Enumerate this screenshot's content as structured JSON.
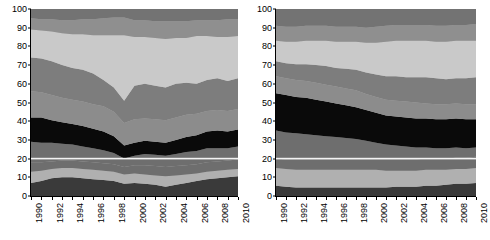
{
  "figure": {
    "type": "two-panel-stacked-area",
    "background": "#ffffff",
    "panel_count": 2
  },
  "axis": {
    "y_ticks": [
      "0",
      "10",
      "20",
      "30",
      "40",
      "50",
      "60",
      "70",
      "80",
      "90",
      "100"
    ],
    "x_ticks": [
      "1990",
      "1992",
      "1994",
      "1996",
      "1998",
      "2000",
      "2002",
      "2004",
      "2006",
      "2008",
      "2010"
    ],
    "y_min": 0,
    "y_max": 100,
    "x_min": 1990,
    "x_max": 2010
  },
  "colors": {
    "band_1": "#3a3a3a",
    "band_2": "#8c8c8c",
    "band_3": "#b0b0b0",
    "band_4": "#6e6e6e",
    "band_5": "#0a0a0a",
    "band_6": "#737373",
    "band_7": "#a8a8a8",
    "band_8": "#c9c9c9",
    "band_9": "#7d7d7d",
    "band_10": "#8f8f8f",
    "separator": "#f2f2f2",
    "axis": "#000000",
    "text": "#000000"
  },
  "chart_data": [
    {
      "type": "area",
      "title": "",
      "xlabel": "",
      "ylabel": "",
      "stacked": true,
      "normalized": true,
      "ylim": [
        0,
        100
      ],
      "xlim": [
        1990,
        2010
      ],
      "grid": false,
      "legend": "none",
      "panel": "left",
      "x": [
        1990,
        1991,
        1992,
        1993,
        1994,
        1995,
        1996,
        1997,
        1998,
        1999,
        2000,
        2001,
        2002,
        2003,
        2004,
        2005,
        2006,
        2007,
        2008,
        2009,
        2010
      ],
      "series": [
        {
          "name": "band-1",
          "color": "#3a3a3a",
          "values": [
            7.0,
            8.0,
            9.5,
            10.0,
            10.0,
            9.5,
            9.0,
            8.5,
            8.0,
            6.5,
            7.0,
            6.5,
            6.0,
            5.0,
            6.0,
            7.0,
            8.0,
            9.0,
            9.5,
            10.0,
            10.5
          ]
        },
        {
          "name": "band-2",
          "color": "#b0b0b0",
          "values": [
            6.0,
            5.5,
            5.0,
            5.0,
            5.0,
            5.0,
            5.0,
            5.0,
            5.0,
            5.0,
            5.0,
            5.0,
            5.0,
            5.5,
            5.0,
            4.5,
            4.0,
            4.0,
            4.0,
            4.0,
            4.0
          ]
        },
        {
          "name": "band-3",
          "color": "#6e6e6e",
          "values": [
            5.0,
            4.5,
            4.0,
            4.0,
            4.0,
            4.0,
            4.0,
            4.0,
            4.0,
            4.0,
            4.5,
            5.0,
            5.0,
            5.0,
            5.0,
            5.0,
            5.0,
            5.0,
            5.0,
            5.0,
            5.0
          ]
        },
        {
          "name": "band-4",
          "color": "#6e6e6e",
          "values": [
            11.0,
            10.5,
            10.0,
            9.0,
            8.5,
            8.0,
            7.5,
            7.0,
            6.0,
            4.5,
            5.0,
            6.0,
            6.0,
            6.0,
            6.5,
            7.0,
            7.0,
            7.5,
            7.0,
            6.5,
            7.0
          ]
        },
        {
          "name": "band-5",
          "color": "#0a0a0a",
          "values": [
            13.0,
            13.5,
            12.0,
            11.5,
            11.0,
            11.0,
            10.5,
            10.0,
            9.0,
            7.0,
            7.0,
            7.0,
            7.0,
            7.0,
            7.5,
            8.0,
            8.5,
            9.0,
            9.5,
            9.0,
            9.0
          ]
        },
        {
          "name": "band-6",
          "color": "#8c8c8c",
          "values": [
            14.0,
            13.5,
            13.5,
            13.0,
            13.0,
            13.0,
            13.0,
            13.5,
            13.0,
            12.0,
            12.5,
            12.0,
            12.0,
            12.0,
            12.0,
            12.0,
            11.5,
            11.0,
            11.0,
            11.0,
            11.0
          ]
        },
        {
          "name": "band-7",
          "color": "#7d7d7d",
          "values": [
            18.0,
            18.0,
            18.0,
            17.5,
            17.0,
            17.0,
            16.5,
            14.0,
            13.0,
            12.0,
            18.0,
            18.5,
            18.0,
            17.5,
            18.0,
            17.0,
            16.0,
            16.5,
            17.0,
            16.0,
            16.5
          ]
        },
        {
          "name": "band-8",
          "color": "#c9c9c9",
          "values": [
            15.0,
            15.0,
            16.0,
            17.0,
            18.0,
            19.0,
            20.5,
            24.0,
            28.0,
            35.0,
            26.0,
            25.0,
            25.5,
            26.0,
            24.5,
            24.0,
            25.5,
            23.5,
            22.0,
            23.5,
            22.5
          ]
        },
        {
          "name": "band-9",
          "color": "#8f8f8f",
          "values": [
            6.0,
            6.0,
            6.5,
            7.0,
            7.5,
            8.0,
            8.5,
            9.0,
            9.5,
            9.5,
            9.0,
            9.0,
            9.0,
            9.5,
            9.0,
            9.0,
            8.5,
            8.5,
            9.0,
            9.5,
            9.0
          ]
        },
        {
          "name": "band-10",
          "color": "#737373",
          "values": [
            5.0,
            5.5,
            5.5,
            6.0,
            6.0,
            5.5,
            5.5,
            5.0,
            4.5,
            4.5,
            6.0,
            6.0,
            6.5,
            6.5,
            6.5,
            6.5,
            6.0,
            6.0,
            6.0,
            5.5,
            5.5
          ]
        }
      ],
      "boundaries_1990": [
        7,
        13,
        18,
        29,
        42,
        56,
        74,
        89,
        95,
        100
      ],
      "boundaries_2010": [
        10.5,
        14.5,
        19.5,
        26.5,
        35.5,
        46.5,
        63,
        85.5,
        94.5,
        100
      ],
      "notes": "Pronounced V-shaped dip centred on 1999 in the upper-middle bands; light band expands sharply to its maximum there."
    },
    {
      "type": "area",
      "title": "",
      "xlabel": "",
      "ylabel": "",
      "stacked": true,
      "normalized": true,
      "ylim": [
        0,
        100
      ],
      "xlim": [
        1990,
        2010
      ],
      "grid": false,
      "legend": "none",
      "panel": "right",
      "x": [
        1990,
        1991,
        1992,
        1993,
        1994,
        1995,
        1996,
        1997,
        1998,
        1999,
        2000,
        2001,
        2002,
        2003,
        2004,
        2005,
        2006,
        2007,
        2008,
        2009,
        2010
      ],
      "series": [
        {
          "name": "band-1",
          "color": "#3a3a3a",
          "values": [
            5.5,
            5.0,
            4.5,
            4.5,
            4.5,
            4.5,
            4.5,
            4.5,
            4.5,
            4.5,
            4.5,
            4.5,
            5.0,
            5.0,
            5.0,
            5.5,
            5.5,
            6.0,
            6.5,
            6.5,
            7.0
          ]
        },
        {
          "name": "band-2",
          "color": "#b0b0b0",
          "values": [
            9.5,
            9.5,
            9.5,
            9.5,
            9.5,
            9.5,
            9.5,
            9.5,
            9.5,
            9.5,
            9.5,
            9.0,
            8.5,
            8.5,
            8.5,
            8.5,
            8.5,
            8.0,
            8.0,
            8.0,
            8.0
          ]
        },
        {
          "name": "band-3",
          "color": "#6e6e6e",
          "values": [
            5.0,
            5.0,
            5.5,
            5.5,
            5.5,
            5.5,
            5.5,
            5.5,
            5.5,
            5.5,
            5.5,
            6.0,
            6.0,
            6.0,
            6.0,
            6.0,
            6.0,
            6.0,
            6.0,
            6.0,
            6.0
          ]
        },
        {
          "name": "band-4",
          "color": "#6e6e6e",
          "values": [
            15.0,
            14.5,
            14.0,
            13.5,
            13.0,
            12.5,
            12.0,
            11.5,
            11.0,
            10.0,
            9.0,
            8.0,
            7.5,
            7.0,
            6.5,
            6.0,
            5.5,
            5.5,
            5.5,
            5.0,
            5.0
          ]
        },
        {
          "name": "band-5",
          "color": "#0a0a0a",
          "values": [
            20.0,
            20.0,
            19.5,
            19.5,
            19.0,
            18.5,
            18.0,
            17.5,
            17.0,
            16.5,
            16.0,
            15.5,
            15.5,
            15.5,
            15.5,
            15.5,
            15.5,
            15.5,
            15.5,
            15.5,
            15.0
          ]
        },
        {
          "name": "band-6",
          "color": "#8c8c8c",
          "values": [
            9.0,
            9.0,
            9.0,
            9.0,
            9.0,
            9.0,
            9.0,
            9.0,
            9.0,
            8.5,
            8.5,
            8.5,
            8.5,
            8.5,
            8.5,
            8.0,
            8.0,
            8.0,
            8.0,
            8.0,
            8.0
          ]
        },
        {
          "name": "band-7",
          "color": "#7d7d7d",
          "values": [
            8.0,
            8.0,
            8.5,
            9.0,
            9.5,
            10.0,
            10.0,
            10.5,
            11.0,
            11.5,
            12.0,
            12.5,
            13.0,
            13.0,
            13.5,
            14.0,
            14.0,
            13.5,
            13.5,
            14.0,
            14.5
          ]
        },
        {
          "name": "band-8",
          "color": "#c9c9c9",
          "values": [
            11.0,
            11.5,
            12.0,
            12.5,
            13.0,
            13.5,
            14.0,
            14.5,
            15.0,
            16.0,
            17.0,
            18.5,
            19.0,
            19.5,
            19.5,
            19.5,
            19.5,
            20.0,
            20.0,
            20.0,
            19.5
          ]
        },
        {
          "name": "band-9",
          "color": "#8f8f8f",
          "values": [
            8.0,
            8.0,
            8.0,
            8.0,
            8.0,
            8.0,
            8.0,
            8.0,
            8.0,
            8.0,
            8.5,
            8.5,
            8.5,
            8.5,
            8.5,
            8.5,
            8.5,
            8.5,
            8.5,
            8.5,
            9.0
          ]
        },
        {
          "name": "band-10",
          "color": "#737373",
          "values": [
            9.0,
            9.5,
            9.5,
            9.0,
            9.0,
            9.0,
            9.5,
            9.5,
            9.5,
            10.0,
            9.5,
            9.0,
            8.5,
            8.5,
            8.5,
            8.5,
            9.0,
            9.0,
            8.5,
            8.5,
            8.0
          ]
        }
      ],
      "boundaries_1990": [
        5.5,
        15,
        20,
        35,
        55,
        64,
        72,
        83,
        91,
        100
      ],
      "boundaries_2010": [
        7,
        15,
        21,
        26,
        41,
        49,
        63.5,
        83,
        92,
        100
      ],
      "notes": "Smoother, more monotonic trends than the left panel; black band narrows gradually and shifts downward over time."
    }
  ]
}
